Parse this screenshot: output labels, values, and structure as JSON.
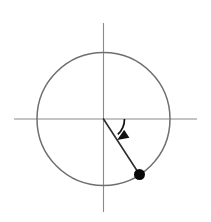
{
  "figure": {
    "background_color": "#ffffff",
    "width": 211,
    "height": 222
  },
  "chart_data": {
    "type": "scatter",
    "title": "",
    "subtitle": "",
    "xlabel": "",
    "ylabel": "",
    "xlim": [
      -1.38,
      1.41
    ],
    "ylim": [
      -1.4,
      1.44
    ],
    "grid": false,
    "legend": false,
    "legend_position": "none",
    "tick_labels": {
      "x": [],
      "y": []
    },
    "annotations": [],
    "series": [
      {
        "name": "terminal-point",
        "marker": "filled-circle",
        "color": "#080808",
        "x": [
          0.5446
        ],
        "y": [
          -0.8387
        ],
        "values": [
          {
            "label": "",
            "x": 0.5446,
            "y": -0.8387,
            "pixel_x": 139.5,
            "pixel_y": 174.5,
            "radius_px": 5.5
          }
        ]
      }
    ],
    "shapes": {
      "unit_circle": {
        "name": "unit-circle",
        "center_x": 0,
        "center_y": 0,
        "radius": 1,
        "pixel_center_x": 103.5,
        "pixel_center_y": 119,
        "pixel_radius": 66.5,
        "color": "#6f6f6f",
        "stroke_width": 1.5
      },
      "x_axis": {
        "name": "x-axis",
        "pixel_x1": 14,
        "pixel_y1": 119,
        "pixel_x2": 197,
        "pixel_y2": 119,
        "color": "#8a8a8a"
      },
      "y_axis": {
        "name": "y-axis",
        "pixel_x1": 103.5,
        "pixel_y1": 23,
        "pixel_x2": 103.5,
        "pixel_y2": 212,
        "color": "#8a8a8a"
      },
      "terminal_ray": {
        "name": "terminal-side-radius",
        "pixel_x1": 103.5,
        "pixel_y1": 119,
        "pixel_x2": 139.5,
        "pixel_y2": 174.5,
        "color": "#2d2d2d",
        "stroke_width": 1.6
      },
      "angle_arc": {
        "name": "angle-arc",
        "angle_start_deg": 0,
        "angle_end_deg": -57,
        "sweep": "clockwise",
        "pixel_radius": 21,
        "color": "#111111",
        "stroke_width": 1.7,
        "arrow_at": "end",
        "path": "M 124.5 119 A 21 21 0 0 1 114.9 136.6",
        "arrowhead_points": "114.9,140.9 122.6,132.7 112.2,134.6"
      }
    }
  }
}
